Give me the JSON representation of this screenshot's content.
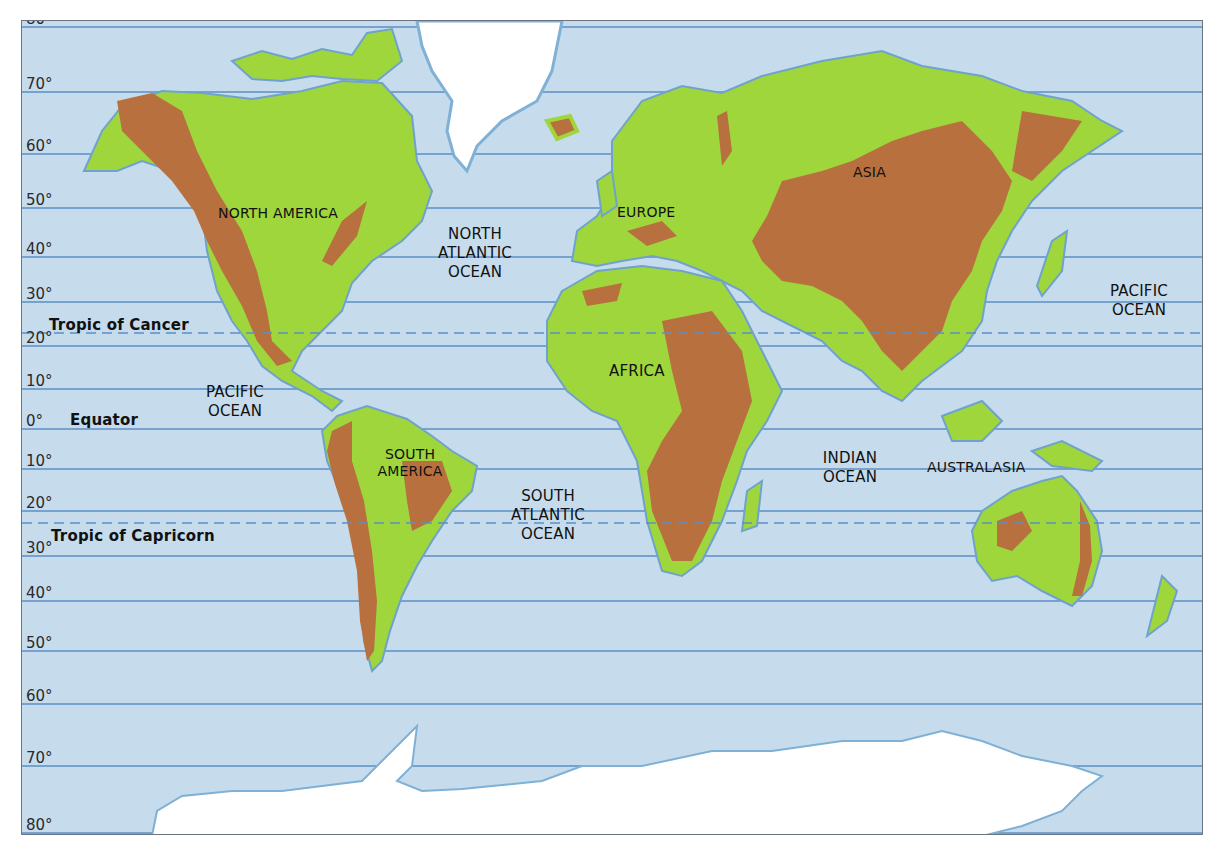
{
  "map": {
    "title": "World physical map with lines of latitude",
    "colors": {
      "ocean": "#c6dcec",
      "latitude_line": "#5b8fc6",
      "lowland": "#9fd63c",
      "highland": "#b8703f",
      "ice": "#ffffff",
      "coast": "#6fa2cc"
    },
    "latitudes": [
      {
        "value": 80,
        "label": "80°"
      },
      {
        "value": 70,
        "label": "70°"
      },
      {
        "value": 60,
        "label": "60°"
      },
      {
        "value": 50,
        "label": "50°"
      },
      {
        "value": 40,
        "label": "40°"
      },
      {
        "value": 30,
        "label": "30°"
      },
      {
        "value": 20,
        "label": "20°"
      },
      {
        "value": 10,
        "label": "10°"
      },
      {
        "value": 0,
        "label": "0°"
      },
      {
        "value": -10,
        "label": "10°"
      },
      {
        "value": -20,
        "label": "20°"
      },
      {
        "value": -30,
        "label": "30°"
      },
      {
        "value": -40,
        "label": "40°"
      },
      {
        "value": -50,
        "label": "50°"
      },
      {
        "value": -60,
        "label": "60°"
      },
      {
        "value": -70,
        "label": "70°"
      },
      {
        "value": -80,
        "label": "80°"
      }
    ],
    "special_lines": {
      "tropic_cancer": "Tropic of Cancer",
      "equator": "Equator",
      "tropic_capricorn": "Tropic of Capricorn"
    },
    "continents": {
      "north_america": "NORTH AMERICA",
      "south_america_1": "SOUTH",
      "south_america_2": "AMERICA",
      "europe": "EUROPE",
      "africa": "AFRICA",
      "asia": "ASIA",
      "australasia": "AUSTRALASIA"
    },
    "oceans": {
      "north_atlantic": [
        "NORTH",
        "ATLANTIC",
        "OCEAN"
      ],
      "south_atlantic": [
        "SOUTH",
        "ATLANTIC",
        "OCEAN"
      ],
      "pacific_west": [
        "PACIFIC",
        "OCEAN"
      ],
      "pacific_east": [
        "PACIFIC",
        "OCEAN"
      ],
      "indian": [
        "INDIAN",
        "OCEAN"
      ]
    }
  }
}
